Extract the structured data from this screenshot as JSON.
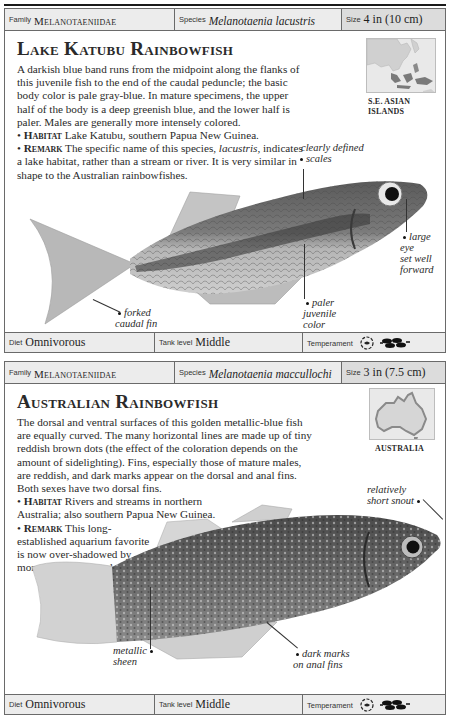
{
  "cards": [
    {
      "header": {
        "family_label": "Family",
        "family_value": "Melanotaeniidae",
        "species_label": "Species",
        "species_value": "Melanotaenia lacustris",
        "size_label": "Size",
        "size_value": "4 in (10 cm)"
      },
      "title": "Lake Katubu Rainbowfish",
      "description": "A darkish blue band runs from the midpoint along the flanks of this juvenile fish to the end of the caudal peduncle; the basic body color is pale gray-blue. In mature specimens, the upper half of the body is a deep greenish blue, and the lower half is paler. Males are generally more intensely colored.",
      "habitat_label": "Habitat",
      "habitat_text": "Lake Katubu, southern Papua New Guinea.",
      "remark_label": "Remark",
      "remark_text_1": "The specific name of this species, ",
      "remark_italic": "lacustris,",
      "remark_text_2": " indicates a lake habitat, rather than a stream or river. It is very similar in shape to the Australian rainbowfishes.",
      "map": {
        "region": "S.E. ASIAN ISLANDS",
        "line1": "S.E. ASIAN",
        "line2": "ISLANDS"
      },
      "callouts": [
        {
          "id": "scales",
          "line1": "clearly defined",
          "line2": "scales"
        },
        {
          "id": "eye",
          "line1": "large eye",
          "line2": "set well",
          "line3": "forward"
        },
        {
          "id": "caudal",
          "line1": "forked",
          "line2": "caudal fin"
        },
        {
          "id": "juvenile",
          "line1": "paler",
          "line2": "juvenile",
          "line3": "color"
        }
      ],
      "footer": {
        "diet_label": "Diet",
        "diet_value": "Omnivorous",
        "tank_label": "Tank level",
        "tank_value": "Middle",
        "temperament_label": "Temperament",
        "temperament_icons": [
          "peaceful-fish-icon",
          "school-group-icon"
        ]
      }
    },
    {
      "header": {
        "family_label": "Family",
        "family_value": "Melanotaeniidae",
        "species_label": "Species",
        "species_value": "Melanotaenia maccullochi",
        "size_label": "Size",
        "size_value": "3 in (7.5 cm)"
      },
      "title": "Australian Rainbowfish",
      "description": "The dorsal and ventral surfaces of this golden metallic-blue fish are equally curved. The many horizontal lines are made up of tiny reddish brown dots (the effect of the coloration depends on the amount of sidelighting). Fins, especially those of mature males, are reddish, and dark marks appear on the dorsal and anal fins. Both sexes have two dorsal fins.",
      "habitat_label": "Habitat",
      "habitat_text": "Rivers and streams in northern Australia; also southern Papua New Guinea.",
      "remark_label": "Remark",
      "remark_text": "This long-established aquarium favorite is now over-shadowed by more gaudily colored species.",
      "map": {
        "region": "AUSTRALIA"
      },
      "callouts": [
        {
          "id": "snout",
          "line1": "relatively",
          "line2": "short snout"
        },
        {
          "id": "sheen",
          "line1": "metallic",
          "line2": "sheen"
        },
        {
          "id": "anal",
          "line1": "dark marks",
          "line2": "on anal fins"
        }
      ],
      "footer": {
        "diet_label": "Diet",
        "diet_value": "Omnivorous",
        "tank_label": "Tank level",
        "tank_value": "Middle",
        "temperament_label": "Temperament",
        "temperament_icons": [
          "peaceful-fish-icon",
          "school-group-icon"
        ]
      }
    }
  ]
}
